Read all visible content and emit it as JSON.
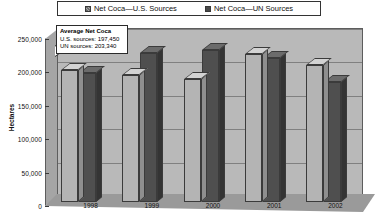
{
  "chart_data": {
    "type": "bar",
    "title": "",
    "xlabel": "",
    "ylabel": "Hectares",
    "categories": [
      "1998",
      "1999",
      "2000",
      "2001",
      "2002"
    ],
    "series": [
      {
        "name": "Net Coca—U.S. Sources",
        "values": [
          197000,
          190000,
          184000,
          222000,
          205000
        ],
        "color": "#b4b4b4"
      },
      {
        "name": "Net Coca—UN Sources",
        "values": [
          193000,
          223000,
          228000,
          215000,
          179000
        ],
        "color": "#4f4f4f"
      }
    ],
    "ylim": [
      0,
      250000
    ],
    "ytick_labels": [
      "0",
      "50,000",
      "100,000",
      "150,000",
      "200,000",
      "250,000"
    ],
    "ytick_values": [
      0,
      50000,
      100000,
      150000,
      200000,
      250000
    ],
    "grid": true,
    "legend_position": "top",
    "style_3d": true,
    "annotations": [
      {
        "name": "average-net-coca-callout",
        "title": "Average Net Coca",
        "lines": [
          "U.S. sources: 197,450",
          "UN sources: 203,340"
        ]
      }
    ]
  },
  "legend": {
    "items": [
      {
        "label": "Net Coca—U.S. Sources",
        "swatch": "us"
      },
      {
        "label": "Net Coca—UN Sources",
        "swatch": "un"
      }
    ]
  },
  "axis": {
    "y_title": "Hectares"
  },
  "callout": {
    "title": "Average Net Coca",
    "line1": "U.S. sources: 197,450",
    "line2": "UN sources: 203,340"
  }
}
